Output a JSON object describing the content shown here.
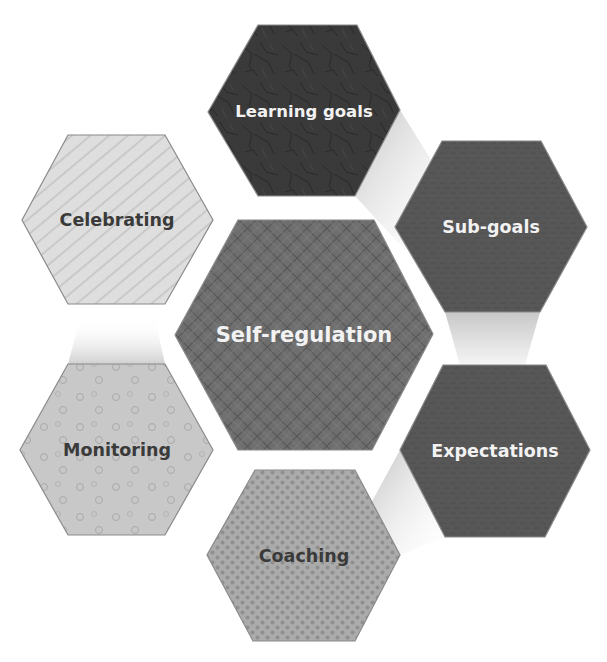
{
  "diagram": {
    "title": "",
    "center": {
      "label": "Self-regulation",
      "fill": "#6b6b6b",
      "pattern": "crosshatch-grid",
      "text_color": "#f2f2f2",
      "points": "238,220 374,220 433,334 372,450 238,450 175,335"
    },
    "nodes": [
      {
        "id": "learning-goals",
        "label": "Learning goals",
        "fill": "#3a3a3a",
        "pattern": "crackle-texture",
        "text_color": "#f2f2f2",
        "points": "258,25 357,25 400,110 355,196 258,196 208,112",
        "cx": 304,
        "cy": 111
      },
      {
        "id": "sub-goals",
        "label": "Sub-goals",
        "fill": "#555555",
        "pattern": "dark-noise",
        "text_color": "#f2f2f2",
        "points": "442,141 541,141 587,227 540,312 445,312 395,227",
        "cx": 491,
        "cy": 227
      },
      {
        "id": "expectations",
        "label": "Expectations",
        "fill": "#5e5e5e",
        "pattern": "dark-noise",
        "text_color": "#f2f2f2",
        "points": "443,365 546,365 590,450 545,537 445,537 400,450",
        "cx": 495,
        "cy": 451
      },
      {
        "id": "coaching",
        "label": "Coaching",
        "fill": "#a8a8a8",
        "pattern": "dense-dots",
        "text_color": "#3a3a3a",
        "points": "255,470 355,470 400,555 355,641 253,641 207,555",
        "cx": 304,
        "cy": 556
      },
      {
        "id": "monitoring",
        "label": "Monitoring",
        "fill": "#c6c6c6",
        "pattern": "sparse-circles",
        "text_color": "#3a3a3a",
        "points": "68,364 165,364 213,450 165,535 68,535 20,450",
        "cx": 117,
        "cy": 450
      },
      {
        "id": "celebrating",
        "label": "Celebrating",
        "fill": "#dcdcdc",
        "pattern": "diagonal-lines",
        "text_color": "#3a3a3a",
        "points": "68,135 165,135 213,220 165,304 68,304 22,220",
        "cx": 117,
        "cy": 220
      }
    ],
    "connectors": [
      {
        "from": "learning-goals",
        "to": "sub-goals",
        "points": "355,196 400,110 450,190 405,250"
      },
      {
        "from": "sub-goals",
        "to": "expectations",
        "points": "445,312 540,312 525,365 460,365"
      },
      {
        "from": "expectations",
        "to": "coaching",
        "points": "400,450 445,537 400,555 370,505"
      },
      {
        "from": "monitoring",
        "to": "celebrating",
        "points": "80,318 155,318 165,364 68,364"
      }
    ]
  }
}
